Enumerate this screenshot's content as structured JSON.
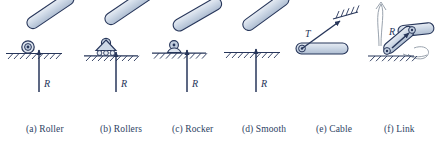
{
  "figure": {
    "kind": "engineering-support-reactions-diagram",
    "background_color": "#ffffff",
    "line_color": "#27365a",
    "body_fill": "#c9d4e2",
    "sketch_color": "#9aa3ae",
    "width": 438,
    "height": 144
  },
  "items": [
    {
      "id": "a",
      "caption_lines": [
        "(a) Roller"
      ],
      "force_label": "R",
      "force_direction": "up",
      "support_type": "roller",
      "caption_x": 26,
      "caption_y": 106,
      "label_x": 44,
      "label_y": 84
    },
    {
      "id": "b",
      "caption_lines": [
        "(b) Rollers"
      ],
      "force_label": "R",
      "force_direction": "up",
      "support_type": "rollers",
      "caption_x": 100,
      "caption_y": 106,
      "label_x": 121,
      "label_y": 84
    },
    {
      "id": "c",
      "caption_lines": [
        "(c) Rocker"
      ],
      "force_label": "R",
      "force_direction": "up",
      "support_type": "rocker",
      "caption_x": 172,
      "caption_y": 106,
      "label_x": 192,
      "label_y": 84
    },
    {
      "id": "d",
      "caption_lines": [
        "(d) Smooth",
        "(frictionless)",
        "surface"
      ],
      "force_label": "R",
      "force_direction": "up",
      "support_type": "smooth-surface",
      "caption_x": 242,
      "caption_y": 106,
      "label_x": 262,
      "label_y": 84
    },
    {
      "id": "e",
      "caption_lines": [
        "(e) Cable"
      ],
      "force_label": "T",
      "force_direction": "along-cable",
      "support_type": "cable",
      "caption_x": 316,
      "caption_y": 106,
      "label_x": 305,
      "label_y": 28
    },
    {
      "id": "f",
      "caption_lines": [
        "(f) Link"
      ],
      "force_label": "R",
      "force_direction": "along-link",
      "support_type": "link",
      "caption_x": 384,
      "caption_y": 106,
      "label_x": 390,
      "label_y": 28
    }
  ]
}
